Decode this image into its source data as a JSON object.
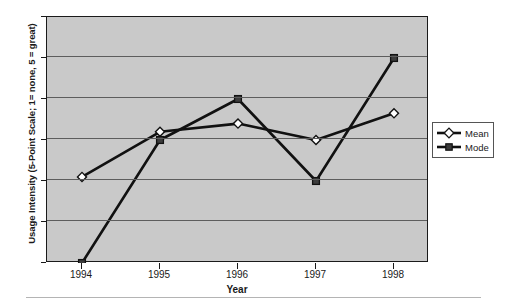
{
  "chart_data": {
    "type": "line",
    "title": "",
    "xlabel": "Year",
    "ylabel": "Usage Intensity (5-Point Scale; 1= none, 5 = great)",
    "categories": [
      "1994",
      "1995",
      "1996",
      "1997",
      "1998"
    ],
    "x": [
      1994,
      1995,
      1996,
      1997,
      1998
    ],
    "series": [
      {
        "name": "Mean",
        "values": [
          2.1,
          3.2,
          3.4,
          3.0,
          3.65
        ],
        "marker": "diamond-hollow"
      },
      {
        "name": "Mode",
        "values": [
          0,
          3,
          4,
          2,
          5
        ],
        "marker": "square-filled"
      }
    ],
    "ylim": [
      0,
      6
    ],
    "yticks": [
      "0",
      "1",
      "2",
      "3",
      "4",
      "5",
      "6"
    ],
    "grid": true,
    "legend_position": "right",
    "plot_background": "#c9c9c9",
    "line_color": "#111111"
  },
  "legend": {
    "entries": [
      {
        "label": "Mean",
        "marker": "diamond-hollow-icon"
      },
      {
        "label": "Mode",
        "marker": "square-filled-icon"
      }
    ]
  },
  "axes": {
    "y_title": "Usage Intensity (5-Point Scale; 1= none, 5 = great)",
    "x_title": "Year",
    "y_tick_labels": [
      "6",
      "5",
      "4",
      "3",
      "2",
      "1",
      "0"
    ],
    "x_tick_labels": [
      "1994",
      "1995",
      "1996",
      "1997",
      "1998"
    ]
  }
}
